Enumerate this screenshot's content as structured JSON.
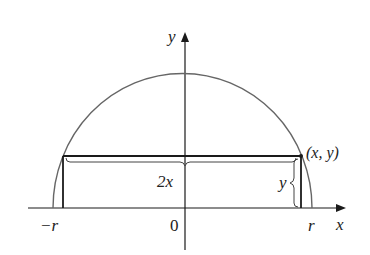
{
  "diagram": {
    "labels": {
      "y_axis": "y",
      "x_axis": "x",
      "origin": "0",
      "neg_r": "−r",
      "pos_r": "r",
      "point": "(x, y)",
      "width": "2x",
      "height": "y"
    },
    "colors": {
      "curve": "#666666",
      "rectangle": "#1a1a1a",
      "axes": "#1a1a1a",
      "text": "#222222"
    }
  }
}
